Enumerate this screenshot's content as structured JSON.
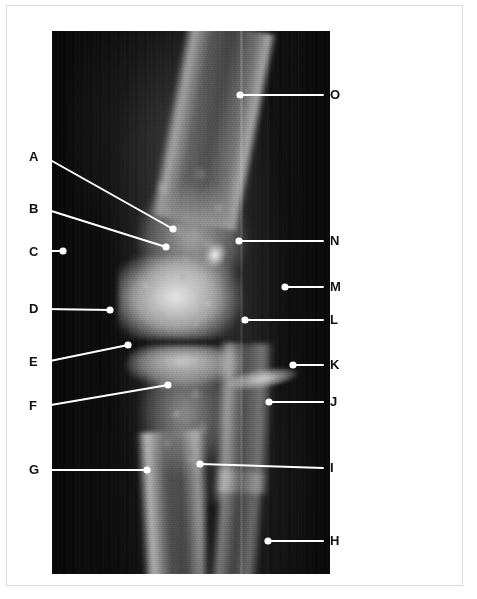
{
  "figure": {
    "kind": "radiograph",
    "frame": {
      "left": 45,
      "top": 25,
      "width": 278,
      "height": 543
    },
    "background_color": "#ffffff",
    "film_color": "#0a0a0a",
    "annotation_color": "#ffffff",
    "label_color": "#111111"
  },
  "labels": {
    "left_column": [
      {
        "id": "A",
        "text": "A",
        "label_x": 29,
        "label_y": 157,
        "line": {
          "x1": 45,
          "y1": 157,
          "x2": 173,
          "y2": 229
        },
        "dot": {
          "x": 173,
          "y": 229
        }
      },
      {
        "id": "B",
        "text": "B",
        "label_x": 29,
        "label_y": 209,
        "line": {
          "x1": 45,
          "y1": 209,
          "x2": 166,
          "y2": 247
        },
        "dot": {
          "x": 166,
          "y": 247
        }
      },
      {
        "id": "C",
        "text": "C",
        "label_x": 29,
        "label_y": 252,
        "line": {
          "x1": 45,
          "y1": 251,
          "x2": 63,
          "y2": 251
        },
        "dot": {
          "x": 63,
          "y": 251
        }
      },
      {
        "id": "D",
        "text": "D",
        "label_x": 29,
        "label_y": 309,
        "line": {
          "x1": 45,
          "y1": 309,
          "x2": 110,
          "y2": 310
        },
        "dot": {
          "x": 110,
          "y": 310
        }
      },
      {
        "id": "E",
        "text": "E",
        "label_x": 29,
        "label_y": 362,
        "line": {
          "x1": 45,
          "y1": 362,
          "x2": 128,
          "y2": 345
        },
        "dot": {
          "x": 128,
          "y": 345
        }
      },
      {
        "id": "F",
        "text": "F",
        "label_x": 29,
        "label_y": 406,
        "line": {
          "x1": 45,
          "y1": 406,
          "x2": 168,
          "y2": 385
        },
        "dot": {
          "x": 168,
          "y": 385
        }
      },
      {
        "id": "G",
        "text": "G",
        "label_x": 29,
        "label_y": 470,
        "line": {
          "x1": 45,
          "y1": 470,
          "x2": 147,
          "y2": 470
        },
        "dot": {
          "x": 147,
          "y": 470
        }
      }
    ],
    "right_column": [
      {
        "id": "O",
        "text": "O",
        "label_x": 330,
        "label_y": 95,
        "line": {
          "x1": 240,
          "y1": 95,
          "x2": 323,
          "y2": 95
        },
        "dot": {
          "x": 240,
          "y": 95
        }
      },
      {
        "id": "N",
        "text": "N",
        "label_x": 330,
        "label_y": 241,
        "line": {
          "x1": 239,
          "y1": 241,
          "x2": 323,
          "y2": 241
        },
        "dot": {
          "x": 239,
          "y": 241
        }
      },
      {
        "id": "M",
        "text": "M",
        "label_x": 330,
        "label_y": 287,
        "line": {
          "x1": 285,
          "y1": 287,
          "x2": 323,
          "y2": 287
        },
        "dot": {
          "x": 285,
          "y": 287
        }
      },
      {
        "id": "L",
        "text": "L",
        "label_x": 330,
        "label_y": 320,
        "line": {
          "x1": 245,
          "y1": 320,
          "x2": 323,
          "y2": 320
        },
        "dot": {
          "x": 245,
          "y": 320
        }
      },
      {
        "id": "K",
        "text": "K",
        "label_x": 330,
        "label_y": 365,
        "line": {
          "x1": 293,
          "y1": 365,
          "x2": 323,
          "y2": 365
        },
        "dot": {
          "x": 293,
          "y": 365
        }
      },
      {
        "id": "J",
        "text": "J",
        "label_x": 330,
        "label_y": 402,
        "line": {
          "x1": 269,
          "y1": 402,
          "x2": 323,
          "y2": 402
        },
        "dot": {
          "x": 269,
          "y": 402
        }
      },
      {
        "id": "I",
        "text": "I",
        "label_x": 330,
        "label_y": 468,
        "line": {
          "x1": 200,
          "y1": 464,
          "x2": 323,
          "y2": 468
        },
        "dot": {
          "x": 200,
          "y": 464
        }
      },
      {
        "id": "H",
        "text": "H",
        "label_x": 330,
        "label_y": 541,
        "line": {
          "x1": 268,
          "y1": 541,
          "x2": 323,
          "y2": 541
        },
        "dot": {
          "x": 268,
          "y": 541
        }
      }
    ]
  }
}
